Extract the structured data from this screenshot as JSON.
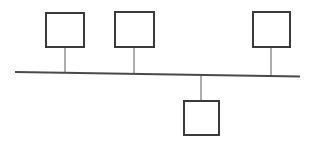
{
  "diagram": {
    "type": "network-bus-topology",
    "canvas": {
      "width": 312,
      "height": 150,
      "background": "#ffffff"
    },
    "colors": {
      "node_stroke": "#3a3a3a",
      "node_fill": "#ffffff",
      "bus_stroke": "#4a4a4a",
      "stem_stroke": "#8a8a8a"
    },
    "bus": {
      "label": "",
      "x1": 15,
      "y1": 72,
      "x2": 300,
      "y2": 76.5,
      "stroke_width": 2.2
    },
    "nodes": [
      {
        "id": "node-1",
        "label": "",
        "x": 45,
        "y": 12,
        "width": 40,
        "height": 36,
        "stroke_width": 2,
        "position": "above",
        "stem": {
          "x": 65,
          "y_from": 48,
          "y_to": 72.3,
          "stroke_width": 1.4
        }
      },
      {
        "id": "node-2",
        "label": "",
        "x": 114,
        "y": 11,
        "width": 41,
        "height": 37,
        "stroke_width": 2,
        "position": "above",
        "stem": {
          "x": 134,
          "y_from": 48,
          "y_to": 73.4,
          "stroke_width": 1.4
        }
      },
      {
        "id": "node-3",
        "label": "",
        "x": 252,
        "y": 11,
        "width": 39,
        "height": 37,
        "stroke_width": 2,
        "position": "above",
        "stem": {
          "x": 271,
          "y_from": 48,
          "y_to": 76.0,
          "stroke_width": 1.4
        }
      },
      {
        "id": "node-4",
        "label": "",
        "x": 183,
        "y": 100,
        "width": 37,
        "height": 36,
        "stroke_width": 2,
        "position": "below",
        "stem": {
          "x": 201,
          "y_from": 74.4,
          "y_to": 100,
          "stroke_width": 1.4
        }
      }
    ]
  }
}
